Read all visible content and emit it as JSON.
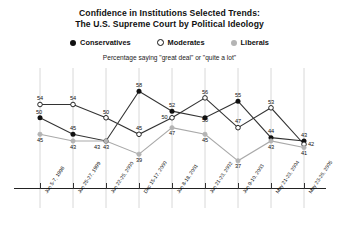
{
  "title": {
    "line1": "Confidence in Institutions Selected Trends:",
    "line2": "The U.S. Supreme Court by Political Ideology"
  },
  "subtitle": "Percentage saying \"great deal\" or \"quite a lot\"",
  "legend": [
    {
      "label": "Conservatives",
      "marker": "filled-dot",
      "color": "#111111"
    },
    {
      "label": "Moderates",
      "marker": "open-circle",
      "color": "#111111"
    },
    {
      "label": "Liberals",
      "marker": "gray-dot",
      "color": "#b4b4b4"
    }
  ],
  "chart_data": {
    "type": "line",
    "title": "Confidence in Institutions Selected Trends: The U.S. Supreme Court by Political Ideology",
    "subtitle": "Percentage saying \"great deal\" or \"quite a lot\"",
    "xlabel": "",
    "ylabel": "",
    "ylim": [
      30,
      62
    ],
    "grid": false,
    "legend_position": "top-center",
    "categories": [
      "Jun 5-7, 1998",
      "Jun 25-27, 1999",
      "Jun 22-25, 2000",
      "Dec 15-17, 2000",
      "Jun 8-18, 2001",
      "Jun 21-23, 2002",
      "Jun 9-10, 2003",
      "May 21-23, 2004",
      "May 23-26, 2005"
    ],
    "series": [
      {
        "name": "Conservatives",
        "color": "#111111",
        "marker": "filled-dot",
        "values": [
          50,
          45,
          43,
          58,
          52,
          50,
          55,
          44,
          43
        ]
      },
      {
        "name": "Moderates",
        "color": "#111111",
        "marker": "open-circle",
        "values": [
          54,
          54,
          50,
          45,
          50,
          56,
          47,
          53,
          42
        ]
      },
      {
        "name": "Liberals",
        "color": "#b4b4b4",
        "marker": "gray-dot",
        "values": [
          45,
          43,
          43,
          39,
          47,
          45,
          37,
          43,
          41
        ]
      }
    ]
  }
}
